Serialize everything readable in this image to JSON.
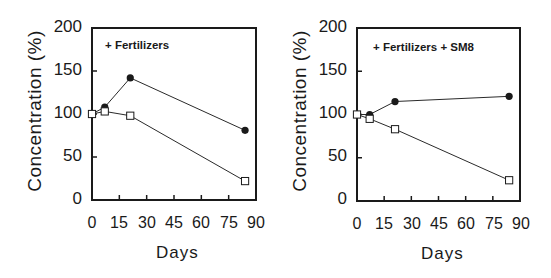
{
  "chart_data": [
    {
      "type": "line",
      "title": "+ Fertilizers",
      "xlabel": "Days",
      "ylabel": "Concentration (%)",
      "xlim": [
        0,
        90
      ],
      "ylim": [
        0,
        200
      ],
      "xticks": [
        "0",
        "15",
        "30",
        "45",
        "60",
        "75",
        "90"
      ],
      "yticks": [
        "0",
        "50",
        "100",
        "150",
        "200"
      ],
      "grid": false,
      "legend": "none",
      "annotation": "+ Fertilizers",
      "x": [
        0,
        7,
        21,
        84
      ],
      "series": [
        {
          "name": "filled-circle",
          "marker": "filled-circle",
          "values": [
            100,
            108,
            142,
            81
          ]
        },
        {
          "name": "open-square",
          "marker": "open-square",
          "values": [
            100,
            103,
            98,
            22
          ]
        }
      ]
    },
    {
      "type": "line",
      "title": "+ Fertilizers + SM8",
      "xlabel": "Days",
      "ylabel": "Concentration (%)",
      "xlim": [
        0,
        90
      ],
      "ylim": [
        0,
        200
      ],
      "xticks": [
        "0",
        "15",
        "30",
        "45",
        "60",
        "75",
        "90"
      ],
      "yticks": [
        "0",
        "50",
        "100",
        "150",
        "200"
      ],
      "grid": false,
      "legend": "none",
      "annotation": "+ Fertilizers + SM8",
      "x": [
        0,
        7,
        21,
        84
      ],
      "series": [
        {
          "name": "filled-circle",
          "marker": "filled-circle",
          "values": [
            100,
            100,
            115,
            121
          ]
        },
        {
          "name": "open-square",
          "marker": "open-square",
          "values": [
            100,
            95,
            83,
            24
          ]
        }
      ]
    }
  ],
  "left": {
    "annotation": "+ Fertilizers",
    "ylabel": "Concentration (%)",
    "xlabel": "Days",
    "yticks": [
      "200",
      "150",
      "100",
      "50",
      "0"
    ],
    "xticks": [
      "0",
      "15",
      "30",
      "45",
      "60",
      "75",
      "90"
    ]
  },
  "right": {
    "annotation": "+ Fertilizers + SM8",
    "ylabel": "Concentration (%)",
    "xlabel": "Days",
    "yticks": [
      "200",
      "150",
      "100",
      "50",
      "0"
    ],
    "xticks": [
      "0",
      "15",
      "30",
      "45",
      "60",
      "75",
      "90"
    ]
  }
}
